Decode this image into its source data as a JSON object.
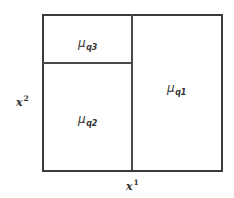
{
  "diagram": {
    "type": "partition",
    "regions": [
      {
        "id": "q1",
        "symbol": "μ",
        "subscript": "q1",
        "position": "right full-height"
      },
      {
        "id": "q2",
        "symbol": "μ",
        "subscript": "q2",
        "position": "left lower"
      },
      {
        "id": "q3",
        "symbol": "μ",
        "subscript": "q3",
        "position": "left upper"
      }
    ],
    "axes": {
      "x": {
        "base": "x",
        "superscript": "1"
      },
      "y": {
        "base": "x",
        "superscript": "2"
      }
    },
    "colors": {
      "border": "#3a3a3a",
      "divider": "#4a4a4a",
      "text": "#333333",
      "background": "#ffffff"
    }
  }
}
